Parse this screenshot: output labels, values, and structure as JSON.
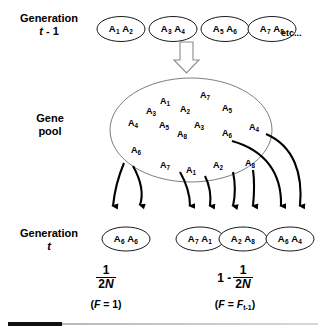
{
  "figure": {
    "background_color": "#ffffff",
    "line_color": "#000000"
  },
  "rows": {
    "generation_prev": {
      "label_line1": "Generation",
      "label_line2_italic": "t",
      "label_line2_rest": " - 1",
      "etc": "etc...",
      "genotypes": [
        {
          "allele1": "A",
          "sub1": "1",
          "allele2": "A",
          "sub2": "2"
        },
        {
          "allele1": "A",
          "sub1": "3",
          "allele2": "A",
          "sub2": "4"
        },
        {
          "allele1": "A",
          "sub1": "5",
          "allele2": "A",
          "sub2": "6"
        },
        {
          "allele1": "A",
          "sub1": "7",
          "allele2": "A",
          "sub2": "8"
        }
      ]
    },
    "gene_pool": {
      "label_line1": "Gene",
      "label_line2": "pool",
      "alleles": [
        {
          "name": "A",
          "sub": "1"
        },
        {
          "name": "A",
          "sub": "7"
        },
        {
          "name": "A",
          "sub": "2"
        },
        {
          "name": "A",
          "sub": "5"
        },
        {
          "name": "A",
          "sub": "3"
        },
        {
          "name": "A",
          "sub": "4"
        },
        {
          "name": "A",
          "sub": "5"
        },
        {
          "name": "A",
          "sub": "3"
        },
        {
          "name": "A",
          "sub": "6"
        },
        {
          "name": "A",
          "sub": "4"
        },
        {
          "name": "A",
          "sub": "8"
        },
        {
          "name": "A",
          "sub": "6"
        },
        {
          "name": "A",
          "sub": "7"
        },
        {
          "name": "A",
          "sub": "1"
        },
        {
          "name": "A",
          "sub": "2"
        },
        {
          "name": "A",
          "sub": "8"
        }
      ]
    },
    "generation_t": {
      "label_line1": "Generation",
      "label_line2_italic": "t",
      "genotypes": [
        {
          "allele1": "A",
          "sub1": "6",
          "allele2": "A",
          "sub2": "6"
        },
        {
          "allele1": "A",
          "sub1": "7",
          "allele2": "A",
          "sub2": "1"
        },
        {
          "allele1": "A",
          "sub1": "2",
          "allele2": "A",
          "sub2": "8"
        },
        {
          "allele1": "A",
          "sub1": "6",
          "allele2": "A",
          "sub2": "4"
        }
      ]
    }
  },
  "formulas": {
    "left": {
      "numerator": "1",
      "denominator_prefix": "2",
      "denominator_italic": "N",
      "condition_open": "(",
      "condition_f": "F",
      "condition_eq": " = 1",
      "condition_close": ")"
    },
    "right": {
      "lead": "1 -",
      "numerator": "1",
      "denominator_prefix": "2",
      "denominator_italic": "N",
      "condition_open": "(",
      "condition_f": "F",
      "condition_eq": " = ",
      "condition_f2": "F",
      "condition_sub": "t-1",
      "condition_close": ")"
    }
  },
  "colors": {
    "rule_dark": "#111111",
    "rule_light": "#cccccc",
    "stroke": "#000000"
  }
}
